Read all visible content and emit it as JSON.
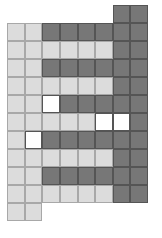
{
  "diagram": {
    "type": "grid-tiling",
    "columns": 8,
    "rows": 12,
    "colors": {
      "light": "#dcdcdc",
      "dark": "#777777",
      "white": "#ffffff"
    },
    "grid": [
      ".,.,.,.,.,.,D,D",
      "L,L,D,D,D,D,D,D",
      "L,L,L,L,L,L,D,D",
      "L,L,D,D,D,D,D,D",
      "L,L,L,L,L,L,D,D",
      "L,L,W,D,D,D,D,D",
      "L,L,L,L,L,W,W,D",
      "L,W,D,D,D,D,D,D",
      "L,L,L,L,L,L,D,D",
      "L,L,D,D,D,D,D,D",
      "L,L,L,L,L,L,D,D",
      "L,L,.,.,.,.,.,."
    ]
  }
}
